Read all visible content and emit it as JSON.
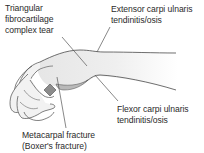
{
  "diagram": {
    "labels": {
      "tfcc": {
        "lines": [
          "Triangular",
          "fibrocartilage",
          "complex tear"
        ]
      },
      "ecu": {
        "lines": [
          "Extensor carpi ulnaris",
          "tendinitis/osis"
        ]
      },
      "fcu": {
        "lines": [
          "Flexor carpi ulnaris",
          "tendinitis/osis"
        ]
      },
      "metacarpal": {
        "lines": [
          "Metacarpal fracture",
          "(Boxer's fracture)"
        ]
      }
    },
    "colors": {
      "outline": "#4a4a4a",
      "skin_fill": "#ececec",
      "fracture_fill": "#8c8c8c",
      "leader": "#555555",
      "text": "#2a2a2a"
    }
  }
}
